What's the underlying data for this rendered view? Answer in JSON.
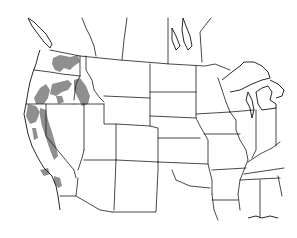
{
  "map": {
    "title": "",
    "type": "species distribution range map",
    "region": "Western and Central United States with southern Canada",
    "colors": {
      "background": "#ffffff",
      "borders": "#1a1a1a",
      "range_fill": "#8f8f8f"
    },
    "range_regions": [
      "Northeastern Washington",
      "Central and eastern Oregon",
      "Central Idaho",
      "Northern California",
      "Sierra Nevada, California",
      "Southern California mountains"
    ],
    "labels": []
  }
}
